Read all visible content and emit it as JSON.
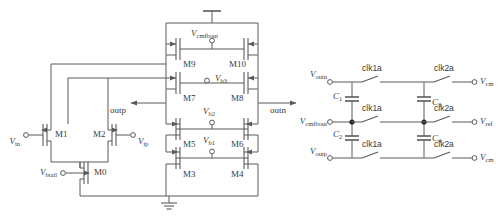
{
  "figure": {
    "type": "circuit-schematic",
    "background": "#ffffff",
    "line_color": "#5a5a5a",
    "text_color": "#3a3a3a"
  },
  "amplifier": {
    "title": "folded-cascode amplifier core",
    "supply_symbol": "vdd-rail",
    "ground_symbol": "ground",
    "transistors": [
      {
        "id": "M0",
        "label": "M0",
        "type": "nmos",
        "role": "tail-current-source"
      },
      {
        "id": "M1",
        "label": "M1",
        "type": "nmos",
        "role": "input-pair-negative"
      },
      {
        "id": "M2",
        "label": "M2",
        "type": "nmos",
        "role": "input-pair-positive"
      },
      {
        "id": "M3",
        "label": "M3",
        "type": "nmos",
        "role": "cascode-lower-left"
      },
      {
        "id": "M4",
        "label": "M4",
        "type": "nmos",
        "role": "cascode-lower-right"
      },
      {
        "id": "M5",
        "label": "M5",
        "type": "nmos",
        "role": "cascode-upper-left"
      },
      {
        "id": "M6",
        "label": "M6",
        "type": "nmos",
        "role": "cascode-upper-right"
      },
      {
        "id": "M7",
        "label": "M7",
        "type": "pmos",
        "role": "pmos-cascode-left"
      },
      {
        "id": "M8",
        "label": "M8",
        "type": "pmos",
        "role": "pmos-cascode-right"
      },
      {
        "id": "M9",
        "label": "M9",
        "type": "pmos",
        "role": "cmfb-load-left"
      },
      {
        "id": "M10",
        "label": "M10",
        "type": "pmos",
        "role": "cmfb-load-right"
      }
    ],
    "bias_nodes": [
      {
        "id": "vcmfbout",
        "v": "V",
        "sub": "cmfbout",
        "at": "gates-M9-M10"
      },
      {
        "id": "vb3",
        "v": "V",
        "sub": "b3",
        "at": "gates-M7-M8"
      },
      {
        "id": "vb2",
        "v": "V",
        "sub": "b2",
        "at": "gates-M5-M6"
      },
      {
        "id": "vb1",
        "v": "V",
        "sub": "b1",
        "at": "gates-M3-M4"
      },
      {
        "id": "vbtail",
        "v": "V",
        "sub": "btail",
        "at": "gate-M0"
      }
    ],
    "inputs": [
      {
        "id": "vin",
        "v": "V",
        "sub": "in",
        "at": "gate-M1"
      },
      {
        "id": "vip",
        "v": "V",
        "sub": "ip",
        "at": "gate-M2"
      }
    ],
    "outputs": [
      {
        "id": "outp",
        "label": "outp",
        "direction": "left"
      },
      {
        "id": "outn",
        "label": "outn",
        "direction": "right"
      }
    ]
  },
  "cmfb_network": {
    "title": "switched-capacitor common-mode feedback network",
    "left_terminals": [
      {
        "id": "voutn",
        "v": "V",
        "sub": "outn",
        "row": "top"
      },
      {
        "id": "vcmfbout",
        "v": "V",
        "sub": "cmfbout",
        "row": "middle"
      },
      {
        "id": "voutp",
        "v": "V",
        "sub": "outp",
        "row": "bottom"
      }
    ],
    "right_terminals": [
      {
        "id": "vcm_top",
        "v": "V",
        "sub": "cm",
        "row": "top"
      },
      {
        "id": "vref",
        "v": "V",
        "sub": "ref",
        "row": "middle"
      },
      {
        "id": "vcm_bot",
        "v": "V",
        "sub": "cm",
        "row": "bottom"
      }
    ],
    "capacitors": [
      {
        "id": "C1",
        "c": "C",
        "sub": "1",
        "branch": "left",
        "between": "top-middle"
      },
      {
        "id": "C2",
        "c": "C",
        "sub": "2",
        "branch": "left",
        "between": "middle-bottom"
      },
      {
        "id": "C3",
        "c": "C",
        "sub": "3",
        "branch": "right",
        "between": "top-middle"
      },
      {
        "id": "C4",
        "c": "C",
        "sub": "4",
        "branch": "right",
        "between": "middle-bottom"
      }
    ],
    "switches": [
      {
        "id": "sw1",
        "label": "clk1a",
        "row": "top",
        "column": "left",
        "state": "open"
      },
      {
        "id": "sw2",
        "label": "clk1a",
        "row": "middle",
        "column": "left",
        "state": "open"
      },
      {
        "id": "sw3",
        "label": "clk1a",
        "row": "bottom",
        "column": "left",
        "state": "open"
      },
      {
        "id": "sw4",
        "label": "clk2a",
        "row": "top",
        "column": "right",
        "state": "open"
      },
      {
        "id": "sw5",
        "label": "clk2a",
        "row": "middle",
        "column": "right",
        "state": "open"
      },
      {
        "id": "sw6",
        "label": "clk2a",
        "row": "bottom",
        "column": "right",
        "state": "open"
      }
    ]
  }
}
